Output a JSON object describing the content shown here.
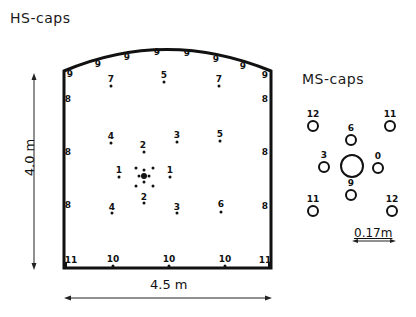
{
  "hs_caps": {
    "title": "HS-caps",
    "width_label": "4.5 m",
    "height_label": "4.0 m",
    "points": [
      {
        "label": "9",
        "x": 70,
        "y": 74
      },
      {
        "label": "9",
        "x": 98,
        "y": 64
      },
      {
        "label": "9",
        "x": 127,
        "y": 57
      },
      {
        "label": "9",
        "x": 157,
        "y": 52
      },
      {
        "label": "9",
        "x": 187,
        "y": 53
      },
      {
        "label": "9",
        "x": 216,
        "y": 59
      },
      {
        "label": "9",
        "x": 243,
        "y": 66
      },
      {
        "label": "9",
        "x": 265,
        "y": 75
      },
      {
        "label": "7",
        "x": 111,
        "y": 79
      },
      {
        "label": "5",
        "x": 164,
        "y": 75
      },
      {
        "label": "7",
        "x": 219,
        "y": 79
      },
      {
        "label": "8",
        "x": 68,
        "y": 99
      },
      {
        "label": "8",
        "x": 265,
        "y": 99
      },
      {
        "label": "4",
        "x": 111,
        "y": 136
      },
      {
        "label": "2",
        "x": 143,
        "y": 145
      },
      {
        "label": "3",
        "x": 177,
        "y": 135
      },
      {
        "label": "5",
        "x": 220,
        "y": 134
      },
      {
        "label": "8",
        "x": 68,
        "y": 152
      },
      {
        "label": "8",
        "x": 265,
        "y": 152
      },
      {
        "label": "1",
        "x": 119,
        "y": 170
      },
      {
        "label": "1",
        "x": 170,
        "y": 170
      },
      {
        "label": "2",
        "x": 144,
        "y": 197
      },
      {
        "label": "8",
        "x": 68,
        "y": 205
      },
      {
        "label": "4",
        "x": 112,
        "y": 207
      },
      {
        "label": "3",
        "x": 177,
        "y": 207
      },
      {
        "label": "6",
        "x": 221,
        "y": 204
      },
      {
        "label": "8",
        "x": 265,
        "y": 206
      },
      {
        "label": "11",
        "x": 71,
        "y": 260
      },
      {
        "label": "10",
        "x": 113,
        "y": 259
      },
      {
        "label": "10",
        "x": 169,
        "y": 259
      },
      {
        "label": "10",
        "x": 225,
        "y": 259
      },
      {
        "label": "11",
        "x": 265,
        "y": 260
      }
    ],
    "dots": [
      {
        "x": 111,
        "y": 86
      },
      {
        "x": 164,
        "y": 82
      },
      {
        "x": 219,
        "y": 86
      },
      {
        "x": 111,
        "y": 143
      },
      {
        "x": 144,
        "y": 152
      },
      {
        "x": 177,
        "y": 142
      },
      {
        "x": 220,
        "y": 141
      },
      {
        "x": 119,
        "y": 177
      },
      {
        "x": 170,
        "y": 177
      },
      {
        "x": 144,
        "y": 203
      },
      {
        "x": 112,
        "y": 213
      },
      {
        "x": 177,
        "y": 213
      },
      {
        "x": 221,
        "y": 212
      },
      {
        "x": 136,
        "y": 168
      },
      {
        "x": 153,
        "y": 168
      },
      {
        "x": 144,
        "y": 170
      },
      {
        "x": 139,
        "y": 176
      },
      {
        "x": 149,
        "y": 176
      },
      {
        "x": 144,
        "y": 182
      },
      {
        "x": 136,
        "y": 186
      },
      {
        "x": 153,
        "y": 186
      },
      {
        "x": 113,
        "y": 266
      },
      {
        "x": 169,
        "y": 266
      },
      {
        "x": 225,
        "y": 266
      }
    ],
    "center_dot": {
      "x": 144,
      "y": 176
    }
  },
  "ms_caps": {
    "title": "MS-caps",
    "scale_label": "0.17m",
    "caps": [
      {
        "label": "12",
        "x": 313,
        "y": 126,
        "r": 5
      },
      {
        "label": "11",
        "x": 390,
        "y": 126,
        "r": 5
      },
      {
        "label": "6",
        "x": 351,
        "y": 140,
        "r": 5
      },
      {
        "label": "3",
        "x": 324,
        "y": 167,
        "r": 5
      },
      {
        "label": "",
        "x": 352,
        "y": 166,
        "r": 11
      },
      {
        "label": "0",
        "x": 378,
        "y": 168,
        "r": 5
      },
      {
        "label": "9",
        "x": 351,
        "y": 195,
        "r": 5
      },
      {
        "label": "11",
        "x": 313,
        "y": 211,
        "r": 5
      },
      {
        "label": "12",
        "x": 392,
        "y": 211,
        "r": 5
      }
    ]
  }
}
